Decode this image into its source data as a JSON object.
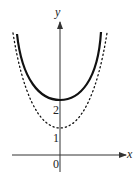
{
  "axes": {
    "x_label": "x",
    "y_label": "y",
    "origin_label": "0",
    "tick_labels": [
      "1",
      "2"
    ]
  },
  "curves": [
    {
      "name": "solid-curve",
      "style": "solid",
      "min_y": 2,
      "description": "U-shaped curve with minimum at (0, 2)"
    },
    {
      "name": "dotted-curve",
      "style": "dotted",
      "min_y": 1,
      "description": "U-shaped curve with minimum at (0, 1)"
    }
  ],
  "colors": {
    "curve": "#111111",
    "axis": "#333333"
  }
}
